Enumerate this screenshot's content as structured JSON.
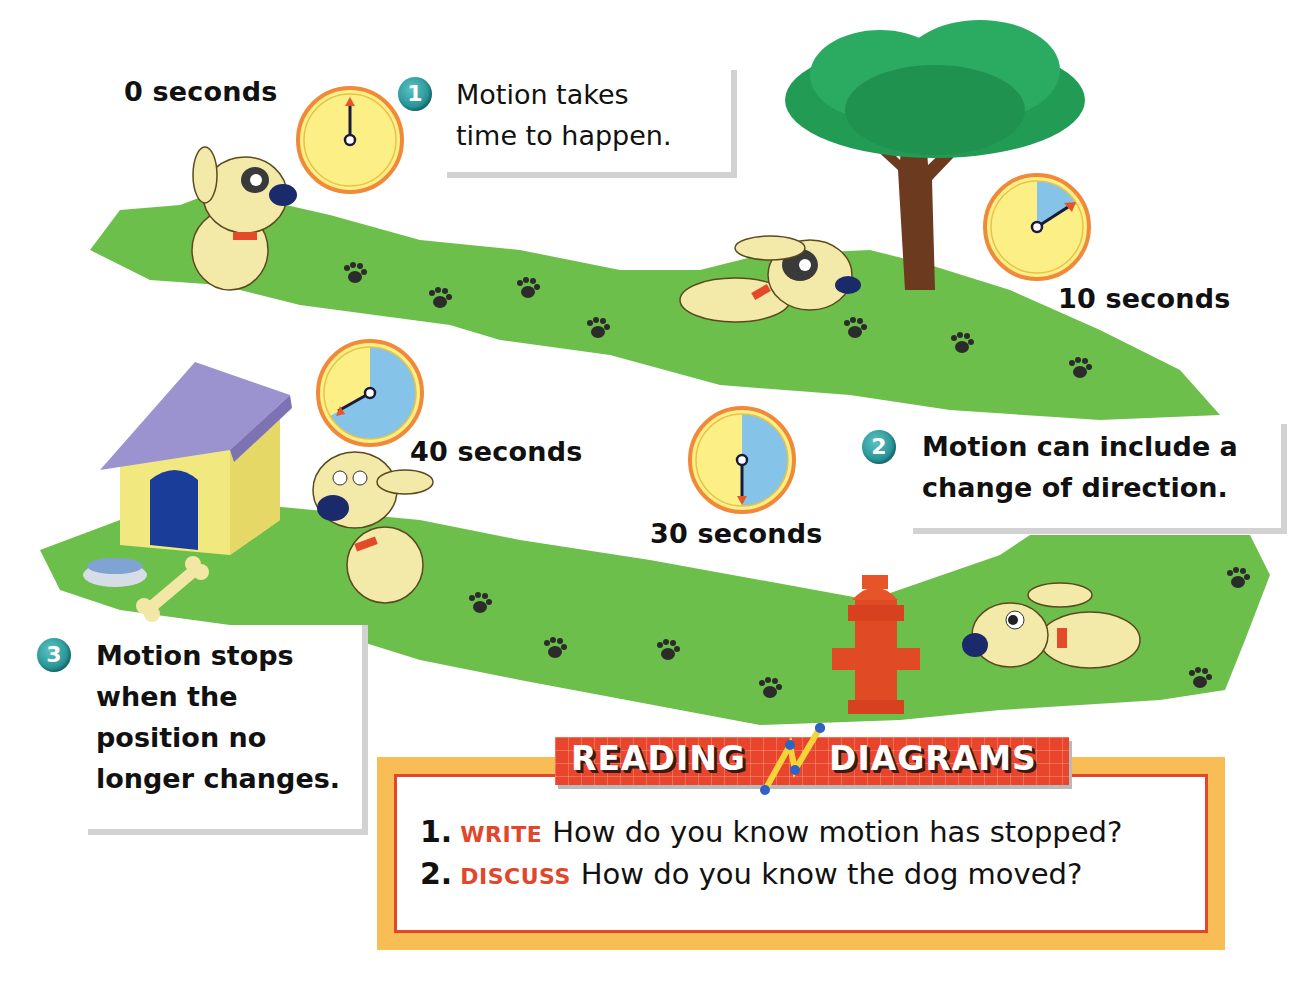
{
  "diagram": {
    "colors": {
      "grass": "#6cbf4a",
      "clock_face": "#fcef86",
      "clock_elapsed": "#86c3e8",
      "clock_rim": "#f0893a",
      "callout_badge": "#1f8c8f",
      "accent_red": "#e2462b",
      "box_orange": "#f8be55"
    },
    "time_labels": [
      {
        "label": "0 seconds",
        "elapsed_fraction": 0.0
      },
      {
        "label": "10 seconds",
        "elapsed_fraction": 0.1667
      },
      {
        "label": "30 seconds",
        "elapsed_fraction": 0.5
      },
      {
        "label": "40 seconds",
        "elapsed_fraction": 0.6667
      }
    ],
    "callouts": [
      {
        "number": "1",
        "lines": [
          "Motion takes",
          "time to happen."
        ]
      },
      {
        "number": "2",
        "lines": [
          "Motion can include a",
          "change of direction."
        ]
      },
      {
        "number": "3",
        "lines": [
          "Motion stops",
          "when the",
          "position no",
          "longer changes."
        ]
      }
    ],
    "scene_objects": [
      "dog-sitting",
      "dog-running",
      "tree",
      "fire-hydrant",
      "dog-walking",
      "dog-house",
      "water-bowl",
      "bone",
      "paw-prints"
    ]
  },
  "reading_diagrams": {
    "banner_left": "READING",
    "banner_right": "DIAGRAMS",
    "questions": [
      {
        "number": "1.",
        "verb": "WRITE",
        "text": "How do you know motion has stopped?"
      },
      {
        "number": "2.",
        "verb": "DISCUSS",
        "text": "How do you know the dog moved?"
      }
    ]
  }
}
